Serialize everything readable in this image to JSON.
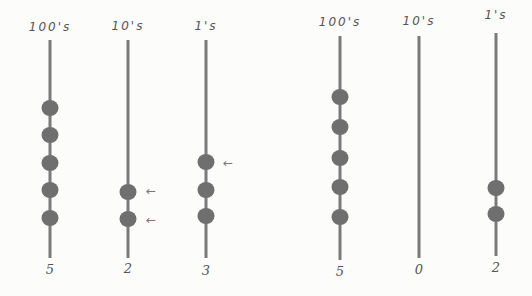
{
  "abaci": [
    {
      "name": "left-abacus",
      "columns": [
        {
          "label": "100's",
          "digit": "5",
          "x": 50,
          "rod_top": 40,
          "rod_bottom": 258,
          "label_y": 20,
          "digit_y": 262,
          "beads": [
            108,
            135,
            163,
            190,
            218
          ],
          "arrows": []
        },
        {
          "label": "10's",
          "digit": "2",
          "x": 128,
          "rod_top": 40,
          "rod_bottom": 258,
          "label_y": 19,
          "digit_y": 261,
          "beads": [
            192,
            219
          ],
          "arrows": [
            {
              "x": 151,
              "y": 191
            },
            {
              "x": 151,
              "y": 220
            }
          ]
        },
        {
          "label": "1's",
          "digit": "3",
          "x": 206,
          "rod_top": 40,
          "rod_bottom": 258,
          "label_y": 19,
          "digit_y": 263,
          "beads": [
            162,
            190,
            216
          ],
          "arrows": [
            {
              "x": 228,
              "y": 163
            }
          ]
        }
      ],
      "arrow_glyph": "←"
    },
    {
      "name": "right-abacus",
      "columns": [
        {
          "label": "100's",
          "digit": "5",
          "x": 340,
          "rod_top": 36,
          "rod_bottom": 260,
          "label_y": 15,
          "digit_y": 264,
          "beads": [
            97,
            127,
            158,
            187,
            217
          ],
          "arrows": []
        },
        {
          "label": "10's",
          "digit": "0",
          "x": 419,
          "rod_top": 36,
          "rod_bottom": 258,
          "label_y": 14,
          "digit_y": 262,
          "beads": [],
          "arrows": []
        },
        {
          "label": "1's",
          "digit": "2",
          "x": 496,
          "rod_top": 33,
          "rod_bottom": 256,
          "label_y": 8,
          "digit_y": 260,
          "beads": [
            188,
            214
          ],
          "arrows": []
        }
      ],
      "arrow_glyph": "←"
    }
  ],
  "colors": {
    "background": "#fcfcfa",
    "rod": "#7a7a7a",
    "bead": "#6f6f6f",
    "text": "#555555"
  }
}
